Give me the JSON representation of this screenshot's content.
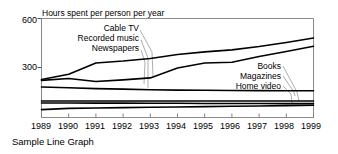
{
  "caption": "Sample Line Graph",
  "chart_data": {
    "type": "line",
    "title": "",
    "ylabel": "Hours spent per person per year",
    "xlabel": "",
    "ylim": [
      0,
      600
    ],
    "yticks": [
      300,
      600
    ],
    "ytick_labels": [
      "300",
      "600"
    ],
    "grid": false,
    "legend_position": "inline-annotations",
    "x": [
      1989,
      1990,
      1991,
      1992,
      1993,
      1994,
      1995,
      1996,
      1997,
      1998,
      1999
    ],
    "xtick_labels": [
      "1989",
      "1990",
      "1991",
      "1992",
      "1993",
      "1994",
      "1995",
      "1996",
      "1997",
      "1998",
      "1999"
    ],
    "series": [
      {
        "name": "Cable TV",
        "label_position": "upper-left",
        "values": [
          230,
          262,
          330,
          342,
          358,
          382,
          398,
          410,
          430,
          455,
          482
        ]
      },
      {
        "name": "Recorded music",
        "label_position": "upper-left",
        "values": [
          225,
          236,
          218,
          228,
          240,
          300,
          330,
          335,
          370,
          400,
          432
        ]
      },
      {
        "name": "Newspapers",
        "label_position": "upper-left",
        "values": [
          185,
          180,
          175,
          172,
          168,
          166,
          165,
          164,
          163,
          162,
          162
        ]
      },
      {
        "name": "Books",
        "label_position": "lower-right",
        "values": [
          100,
          100,
          100,
          100,
          100,
          100,
          100,
          100,
          100,
          100,
          100
        ]
      },
      {
        "name": "Magazines",
        "label_position": "lower-right",
        "values": [
          88,
          88,
          87,
          87,
          86,
          86,
          85,
          85,
          85,
          84,
          84
        ]
      },
      {
        "name": "Home video",
        "label_position": "lower-right",
        "values": [
          48,
          55,
          58,
          60,
          62,
          64,
          66,
          68,
          70,
          72,
          74
        ]
      }
    ],
    "colors": {
      "line": "#000000",
      "axis": "#8a8a8a",
      "leader": "#9a9a9a",
      "background": "#ffffff"
    }
  }
}
